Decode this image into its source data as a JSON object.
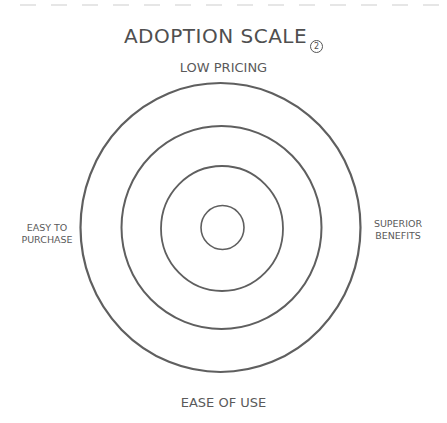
{
  "diagram": {
    "title": "ADOPTION SCALE",
    "title_badge": "2",
    "labels": {
      "top": "LOW PRICING",
      "bottom": "EASE OF USE",
      "left_line1": "EASY TO",
      "left_line2": "PURCHASE",
      "right_line1": "SUPERIOR",
      "right_line2": "BENEFITS"
    },
    "rings": [
      {
        "name": "outer",
        "cx": 220.5,
        "cy": 227.5,
        "rx": 140,
        "ry": 144.5
      },
      {
        "name": "second",
        "cx": 221.5,
        "cy": 227.5,
        "rx": 100,
        "ry": 101.5
      },
      {
        "name": "third",
        "cx": 222,
        "cy": 228.5,
        "rx": 61,
        "ry": 62.5
      },
      {
        "name": "inner",
        "cx": 222.5,
        "cy": 227.5,
        "rx": 21.5,
        "ry": 22
      }
    ],
    "colors": {
      "stroke": "#5f5f5f",
      "text": "#555555",
      "dash": "#e4e4e4",
      "background": "#ffffff"
    }
  }
}
